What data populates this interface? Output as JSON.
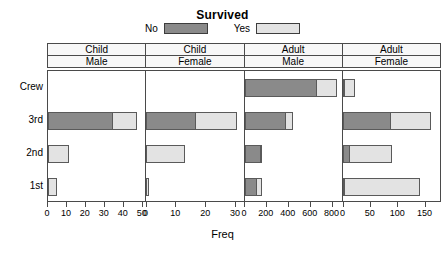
{
  "chart": {
    "title": "Survived",
    "xlabel": "Freq",
    "legend": {
      "items": [
        {
          "label": "No",
          "color": "#8a8a8a"
        },
        {
          "label": "Yes",
          "color": "#e3e3e3"
        }
      ]
    }
  },
  "colors": {
    "no": "#8a8a8a",
    "yes": "#e3e3e3",
    "border": "#5a5a5a",
    "frame": "#4a4a4a",
    "strip_bg": "#f7f7f7",
    "background": "#ffffff"
  },
  "strips": {
    "row1": [
      "Child",
      "Child",
      "Adult",
      "Adult"
    ],
    "row2": [
      "Male",
      "Female",
      "Male",
      "Female"
    ]
  },
  "yaxis": {
    "labels": [
      "Crew",
      "3rd",
      "2nd",
      "1st"
    ]
  },
  "chart_data": {
    "type": "bar",
    "title": "Survived",
    "xlabel": "Freq",
    "ylabel": "",
    "orientation": "horizontal",
    "stacked": true,
    "grid": false,
    "legend_position": "top",
    "legend_title": "Survived",
    "series": [
      {
        "name": "No",
        "color": "#8a8a8a"
      },
      {
        "name": "Yes",
        "color": "#e3e3e3"
      }
    ],
    "categories": [
      "Crew",
      "3rd",
      "2nd",
      "1st"
    ],
    "panels": [
      {
        "age": "Child",
        "sex": "Male",
        "strip_row1": "Child",
        "strip_row2": "Male",
        "xlim": [
          0,
          52
        ],
        "xticks": [
          0,
          10,
          20,
          30,
          40,
          50
        ],
        "values": {
          "Crew": {
            "No": 0,
            "Yes": 0
          },
          "3rd": {
            "No": 35,
            "Yes": 13
          },
          "2nd": {
            "No": 0,
            "Yes": 11
          },
          "1st": {
            "No": 0,
            "Yes": 5
          }
        }
      },
      {
        "age": "Child",
        "sex": "Female",
        "strip_row1": "Child",
        "strip_row2": "Female",
        "xlim": [
          0,
          33
        ],
        "xticks": [
          0,
          10,
          20,
          30
        ],
        "values": {
          "Crew": {
            "No": 0,
            "Yes": 0
          },
          "3rd": {
            "No": 17,
            "Yes": 14
          },
          "2nd": {
            "No": 0,
            "Yes": 13
          },
          "1st": {
            "No": 0,
            "Yes": 1
          }
        }
      },
      {
        "age": "Adult",
        "sex": "Male",
        "strip_row1": "Adult",
        "strip_row2": "Male",
        "xlim": [
          0,
          900
        ],
        "xticks": [
          0,
          200,
          400,
          600,
          800
        ],
        "values": {
          "Crew": {
            "No": 670,
            "Yes": 192
          },
          "3rd": {
            "No": 387,
            "Yes": 75
          },
          "2nd": {
            "No": 154,
            "Yes": 14
          },
          "1st": {
            "No": 118,
            "Yes": 57
          }
        }
      },
      {
        "age": "Adult",
        "sex": "Female",
        "strip_row1": "Adult",
        "strip_row2": "Female",
        "xlim": [
          0,
          180
        ],
        "xticks": [
          0,
          50,
          100,
          150
        ],
        "values": {
          "Crew": {
            "No": 3,
            "Yes": 20
          },
          "3rd": {
            "No": 89,
            "Yes": 76
          },
          "2nd": {
            "No": 13,
            "Yes": 80
          },
          "1st": {
            "No": 4,
            "Yes": 140
          }
        }
      }
    ]
  }
}
